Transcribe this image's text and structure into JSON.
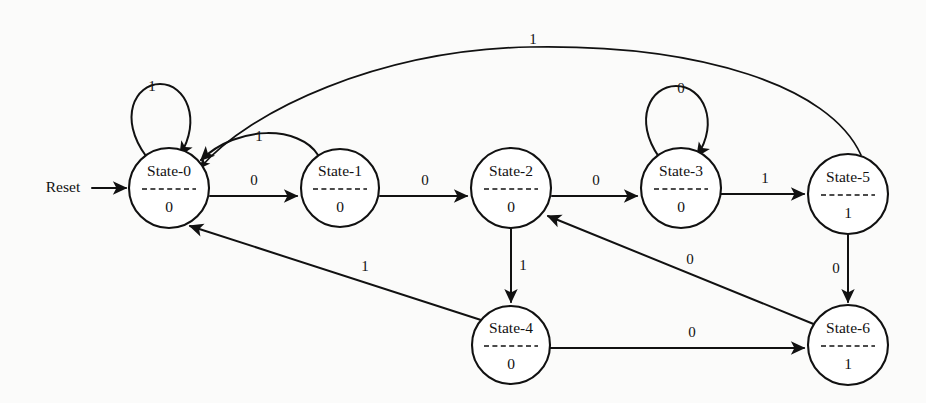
{
  "diagram": {
    "type": "state-transition-diagram",
    "reset_label": "Reset",
    "stroke_color": "#111111",
    "background_color": "#fbfbfa",
    "states": [
      {
        "id": "state-0",
        "name": "State-0",
        "output": "0",
        "cx": 169,
        "cy": 188,
        "r": 40
      },
      {
        "id": "state-1",
        "name": "State-1",
        "output": "0",
        "cx": 340,
        "cy": 188,
        "r": 39
      },
      {
        "id": "state-2",
        "name": "State-2",
        "output": "0",
        "cx": 511,
        "cy": 188,
        "r": 40
      },
      {
        "id": "state-3",
        "name": "State-3",
        "output": "0",
        "cx": 681,
        "cy": 188,
        "r": 40
      },
      {
        "id": "state-5",
        "name": "State-5",
        "output": "1",
        "cx": 848,
        "cy": 194,
        "r": 40
      },
      {
        "id": "state-4",
        "name": "State-4",
        "output": "0",
        "cx": 511,
        "cy": 345,
        "r": 39
      },
      {
        "id": "state-6",
        "name": "State-6",
        "output": "1",
        "cx": 848,
        "cy": 345,
        "r": 40
      }
    ],
    "transitions": [
      {
        "id": "t-reset",
        "from": "reset",
        "to": "state-0",
        "label": "",
        "kind": "reset-arrow"
      },
      {
        "id": "t-0-0",
        "from": "state-0",
        "to": "state-0",
        "label": "1",
        "kind": "self-loop",
        "label_x": 152,
        "label_y": 88
      },
      {
        "id": "t-0-1",
        "from": "state-0",
        "to": "state-1",
        "label": "0",
        "kind": "straight",
        "label_x": 254,
        "label_y": 182
      },
      {
        "id": "t-1-0",
        "from": "state-1",
        "to": "state-0",
        "label": "1",
        "kind": "arc-above",
        "label_x": 259,
        "label_y": 138
      },
      {
        "id": "t-1-2",
        "from": "state-1",
        "to": "state-2",
        "label": "0",
        "kind": "straight",
        "label_x": 425,
        "label_y": 182
      },
      {
        "id": "t-2-3",
        "from": "state-2",
        "to": "state-3",
        "label": "0",
        "kind": "straight",
        "label_x": 596,
        "label_y": 182
      },
      {
        "id": "t-2-4",
        "from": "state-2",
        "to": "state-4",
        "label": "1",
        "kind": "straight-vertical",
        "label_x": 523,
        "label_y": 267
      },
      {
        "id": "t-3-3",
        "from": "state-3",
        "to": "state-3",
        "label": "0",
        "kind": "self-loop",
        "label_x": 681,
        "label_y": 90
      },
      {
        "id": "t-3-5",
        "from": "state-3",
        "to": "state-5",
        "label": "1",
        "kind": "straight",
        "label_x": 765,
        "label_y": 180
      },
      {
        "id": "t-5-0",
        "from": "state-5",
        "to": "state-0",
        "label": "1",
        "kind": "long-arc-top",
        "label_x": 533,
        "label_y": 41
      },
      {
        "id": "t-5-6",
        "from": "state-5",
        "to": "state-6",
        "label": "0",
        "kind": "straight-vertical",
        "label_x": 836,
        "label_y": 270
      },
      {
        "id": "t-4-0",
        "from": "state-4",
        "to": "state-0",
        "label": "1",
        "kind": "diagonal",
        "label_x": 365,
        "label_y": 268
      },
      {
        "id": "t-4-6",
        "from": "state-4",
        "to": "state-6",
        "label": "0",
        "kind": "straight",
        "label_x": 692,
        "label_y": 334
      },
      {
        "id": "t-6-2",
        "from": "state-6",
        "to": "state-2",
        "label": "0",
        "kind": "diagonal",
        "label_x": 690,
        "label_y": 261
      }
    ]
  }
}
